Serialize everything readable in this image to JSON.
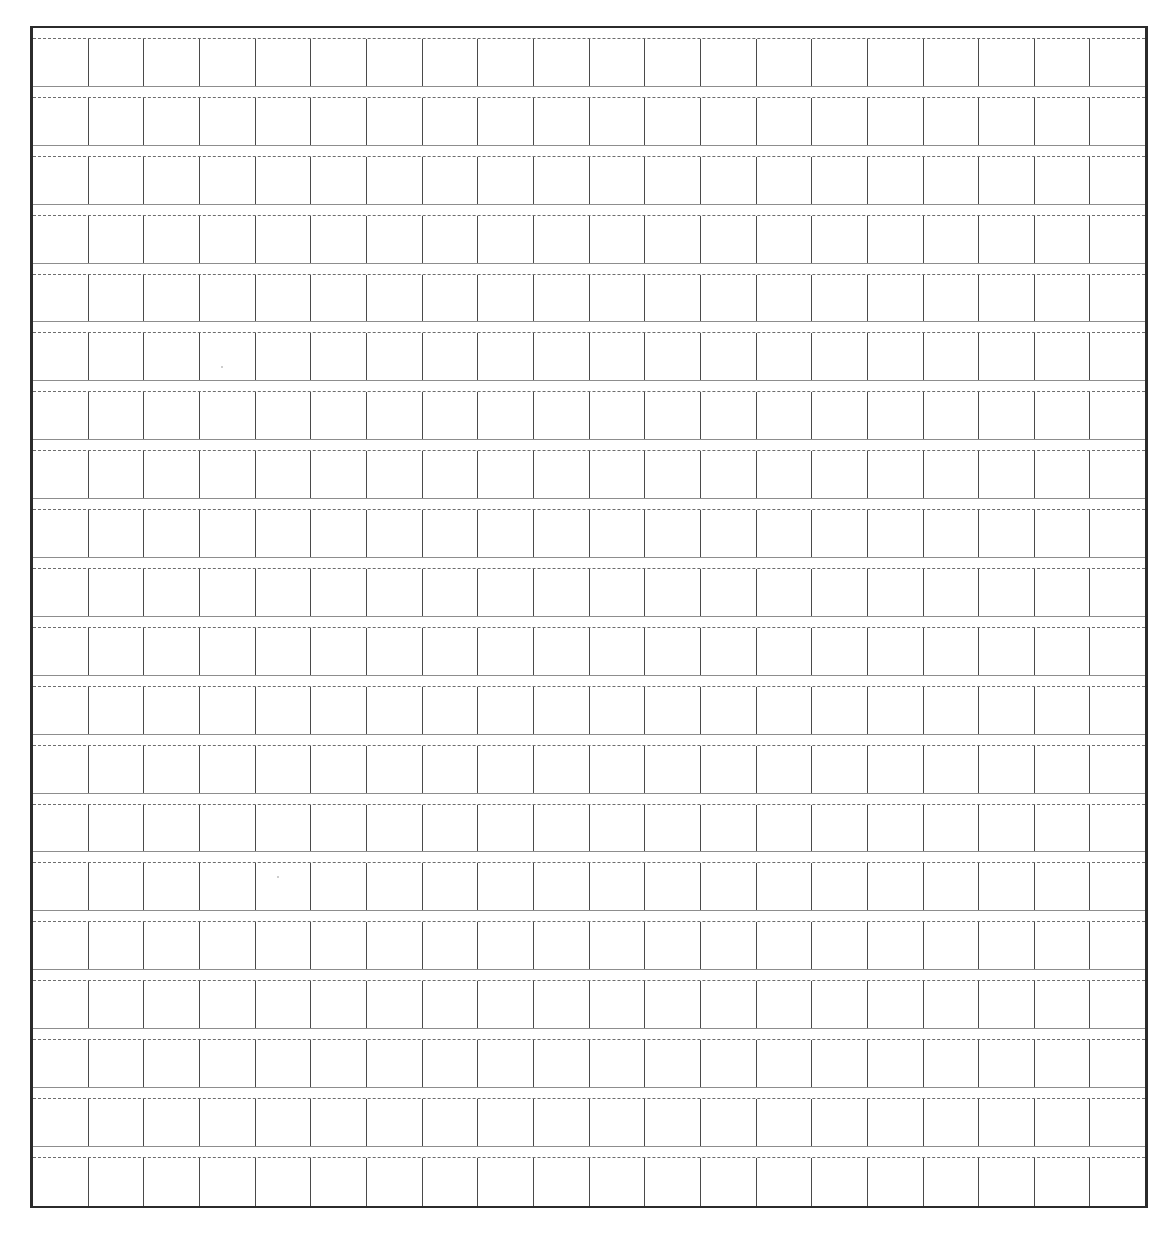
{
  "document": {
    "type": "grid-practice-paper",
    "title": "Blank Squared Writing Practice Sheet",
    "background_color": "#ffffff",
    "border_color": "#2b2b2b",
    "rule_color": "#8d8d8d",
    "cell_line_color": "#4a4a4a",
    "guide_line_color": "#6d6d6d",
    "guide_line_style": "dashed"
  },
  "grid": {
    "rows": 20,
    "columns": 20,
    "cell_width_px": 55.9,
    "row_height_px": 59.1,
    "left_px": 30,
    "top_px": 26,
    "width_px": 1118,
    "height_px": 1182,
    "row_labels": [
      "row-1",
      "row-2",
      "row-3",
      "row-4",
      "row-5",
      "row-6",
      "row-7",
      "row-8",
      "row-9",
      "row-10",
      "row-11",
      "row-12",
      "row-13",
      "row-14",
      "row-15",
      "row-16",
      "row-17",
      "row-18",
      "row-19",
      "row-20"
    ],
    "cell_contents": [
      [
        "",
        "",
        "",
        "",
        "",
        "",
        "",
        "",
        "",
        "",
        "",
        "",
        "",
        "",
        "",
        "",
        "",
        "",
        "",
        ""
      ],
      [
        "",
        "",
        "",
        "",
        "",
        "",
        "",
        "",
        "",
        "",
        "",
        "",
        "",
        "",
        "",
        "",
        "",
        "",
        "",
        ""
      ],
      [
        "",
        "",
        "",
        "",
        "",
        "",
        "",
        "",
        "",
        "",
        "",
        "",
        "",
        "",
        "",
        "",
        "",
        "",
        "",
        ""
      ],
      [
        "",
        "",
        "",
        "",
        "",
        "",
        "",
        "",
        "",
        "",
        "",
        "",
        "",
        "",
        "",
        "",
        "",
        "",
        "",
        ""
      ],
      [
        "",
        "",
        "",
        "",
        "",
        "",
        "",
        "",
        "",
        "",
        "",
        "",
        "",
        "",
        "",
        "",
        "",
        "",
        "",
        ""
      ],
      [
        "",
        "",
        "",
        "",
        "",
        "",
        "",
        "",
        "",
        "",
        "",
        "",
        "",
        "",
        "",
        "",
        "",
        "",
        "",
        ""
      ],
      [
        "",
        "",
        "",
        "",
        "",
        "",
        "",
        "",
        "",
        "",
        "",
        "",
        "",
        "",
        "",
        "",
        "",
        "",
        "",
        ""
      ],
      [
        "",
        "",
        "",
        "",
        "",
        "",
        "",
        "",
        "",
        "",
        "",
        "",
        "",
        "",
        "",
        "",
        "",
        "",
        "",
        ""
      ],
      [
        "",
        "",
        "",
        "",
        "",
        "",
        "",
        "",
        "",
        "",
        "",
        "",
        "",
        "",
        "",
        "",
        "",
        "",
        "",
        ""
      ],
      [
        "",
        "",
        "",
        "",
        "",
        "",
        "",
        "",
        "",
        "",
        "",
        "",
        "",
        "",
        "",
        "",
        "",
        "",
        "",
        ""
      ],
      [
        "",
        "",
        "",
        "",
        "",
        "",
        "",
        "",
        "",
        "",
        "",
        "",
        "",
        "",
        "",
        "",
        "",
        "",
        "",
        ""
      ],
      [
        "",
        "",
        "",
        "",
        "",
        "",
        "",
        "",
        "",
        "",
        "",
        "",
        "",
        "",
        "",
        "",
        "",
        "",
        "",
        ""
      ],
      [
        "",
        "",
        "",
        "",
        "",
        "",
        "",
        "",
        "",
        "",
        "",
        "",
        "",
        "",
        "",
        "",
        "",
        "",
        "",
        ""
      ],
      [
        "",
        "",
        "",
        "",
        "",
        "",
        "",
        "",
        "",
        "",
        "",
        "",
        "",
        "",
        "",
        "",
        "",
        "",
        "",
        ""
      ],
      [
        "",
        "",
        "",
        "",
        "",
        "",
        "",
        "",
        "",
        "",
        "",
        "",
        "",
        "",
        "",
        "",
        "",
        "",
        "",
        ""
      ],
      [
        "",
        "",
        "",
        "",
        "",
        "",
        "",
        "",
        "",
        "",
        "",
        "",
        "",
        "",
        "",
        "",
        "",
        "",
        "",
        ""
      ],
      [
        "",
        "",
        "",
        "",
        "",
        "",
        "",
        "",
        "",
        "",
        "",
        "",
        "",
        "",
        "",
        "",
        "",
        "",
        "",
        ""
      ],
      [
        "",
        "",
        "",
        "",
        "",
        "",
        "",
        "",
        "",
        "",
        "",
        "",
        "",
        "",
        "",
        "",
        "",
        "",
        "",
        ""
      ],
      [
        "",
        "",
        "",
        "",
        "",
        "",
        "",
        "",
        "",
        "",
        "",
        "",
        "",
        "",
        "",
        "",
        "",
        "",
        "",
        ""
      ],
      [
        "",
        "",
        "",
        "",
        "",
        "",
        "",
        "",
        "",
        "",
        "",
        "",
        "",
        "",
        "",
        "",
        "",
        "",
        "",
        ""
      ]
    ]
  },
  "artifacts": [
    {
      "x": 221,
      "y": 366,
      "size": 2
    },
    {
      "x": 277,
      "y": 876,
      "size": 2
    }
  ]
}
